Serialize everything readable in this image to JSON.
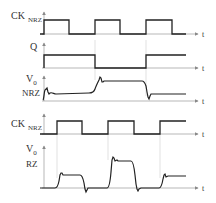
{
  "colors": {
    "trace": "#222222",
    "axis": "#888888",
    "guide": "#cccccc",
    "text": "#333333"
  },
  "rows": [
    {
      "id": "ck_nrz_top",
      "label_main": "CK",
      "label_sub": "NRZ",
      "axis_label": "t"
    },
    {
      "id": "q",
      "label_main": "Q",
      "label_sub": "",
      "axis_label": "t"
    },
    {
      "id": "v0_nrz",
      "label_main": "V0",
      "label_sub": "NRZ",
      "axis_label": "t"
    },
    {
      "id": "ck_nrz_bottom",
      "label_main": "CK",
      "label_sub": "NRZ",
      "axis_label": "t"
    },
    {
      "id": "v0_rz",
      "label_main": "V0",
      "label_sub": "RZ",
      "axis_label": "t"
    }
  ],
  "labels": {
    "ck1_main": "CK",
    "ck1_sub": "NRZ",
    "q": "Q",
    "v0nrz_v": "V",
    "v0nrz_sub": "0",
    "v0nrz_name": "NRZ",
    "ck2_main": "CK",
    "ck2_sub": "NRZ",
    "v0rz_v": "V",
    "v0rz_sub": "0",
    "v0rz_name": "RZ",
    "t": "t"
  }
}
